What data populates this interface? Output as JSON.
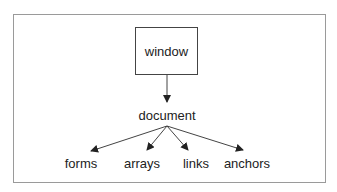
{
  "diagram": {
    "root": {
      "label": "window"
    },
    "child": {
      "label": "document"
    },
    "leaves": [
      {
        "label": "forms"
      },
      {
        "label": "arrays"
      },
      {
        "label": "links"
      },
      {
        "label": "anchors"
      }
    ],
    "colors": {
      "line": "#444444",
      "frame": "#9a9a9a",
      "text": "#222222"
    }
  }
}
